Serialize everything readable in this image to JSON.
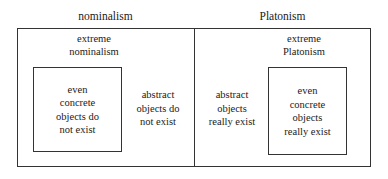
{
  "diagram": {
    "type": "nested-containment-diagram",
    "title_visible": false,
    "colors": {
      "background": "#ffffff",
      "border": "#333333",
      "text": "#1a1a1a"
    },
    "headings": {
      "left": "nominalism",
      "right": "Platonism"
    },
    "left_half": {
      "region_label": "extreme\nnominalism",
      "region_label_line1": "extreme",
      "region_label_line2": "nominalism",
      "outside_inner_text": "abstract\nobjects do\nnot exist",
      "outside_inner_lines": [
        "abstract",
        "objects do",
        "not exist"
      ],
      "inner_box": {
        "text": "even\nconcrete\nobjects do\nnot exist",
        "lines": [
          "even",
          "concrete",
          "objects do",
          "not exist"
        ]
      }
    },
    "right_half": {
      "region_label": "extreme\nPlatonism",
      "region_label_line1": "extreme",
      "region_label_line2": "Platonism",
      "outside_inner_text": "abstract\nobjects\nreally exist",
      "outside_inner_lines": [
        "abstract",
        "objects",
        "really exist"
      ],
      "inner_box": {
        "text": "even\nconcrete\nobjects\nreally exist",
        "lines": [
          "even",
          "concrete",
          "objects",
          "really exist"
        ]
      }
    }
  }
}
